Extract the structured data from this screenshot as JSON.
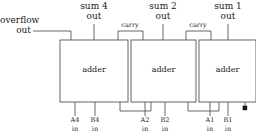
{
  "diagram": {
    "title_text": "",
    "stroke_color": "#555555",
    "text_color": "#1a1a1a",
    "background": "#ffffff",
    "blocks": [
      {
        "id": "adder-4",
        "label": "adder",
        "x": 60,
        "y": 40,
        "w": 68,
        "h": 62
      },
      {
        "id": "adder-2",
        "label": "adder",
        "x": 131,
        "y": 40,
        "w": 65,
        "h": 62
      },
      {
        "id": "adder-1",
        "label": "adder",
        "x": 199,
        "y": 40,
        "w": 57,
        "h": 62
      }
    ],
    "outputs": [
      {
        "name": "sum-4-out",
        "line1": "sum 4",
        "line2": "out",
        "x": 94
      },
      {
        "name": "sum-2-out",
        "line1": "sum 2",
        "line2": "out",
        "x": 163
      },
      {
        "name": "sum-1-out",
        "line1": "sum 1",
        "line2": "out",
        "x": 228
      }
    ],
    "overflow": {
      "name": "overflow-out",
      "line1": "overflow",
      "line2": "out"
    },
    "carries": [
      {
        "name": "carry-4-to-2",
        "label": "carry"
      },
      {
        "name": "carry-2-to-1",
        "label": "carry"
      }
    ],
    "inputs": [
      {
        "name": "A4",
        "line1": "A4",
        "line2": "in",
        "x": 75
      },
      {
        "name": "B4",
        "line1": "B4",
        "line2": "in",
        "x": 95
      },
      {
        "name": "A2",
        "line1": "A2",
        "line2": "in",
        "x": 145
      },
      {
        "name": "B2",
        "line1": "B2",
        "line2": "in",
        "x": 165
      },
      {
        "name": "A1",
        "line1": "A1",
        "line2": "in",
        "x": 210
      },
      {
        "name": "B1",
        "line1": "B1",
        "line2": "in",
        "x": 228
      }
    ],
    "terminal": {
      "name": "carry-in-ground-terminal"
    }
  }
}
